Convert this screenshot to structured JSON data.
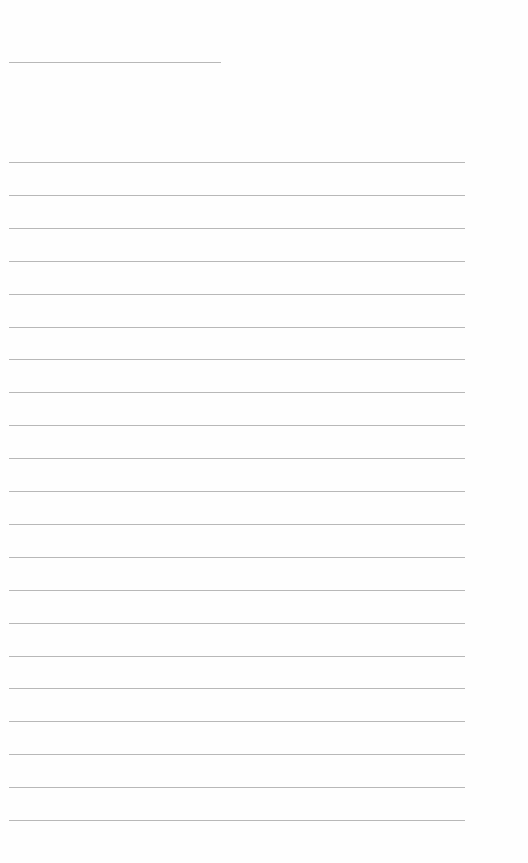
{
  "document": {
    "type": "lined-paper",
    "background_color": "#ffffff",
    "line_color": "#b8b8b8",
    "title_line": {
      "x": 9,
      "y": 62,
      "width": 212
    },
    "ruled_lines": {
      "count": 21,
      "x": 9,
      "width": 456,
      "start_y": 162,
      "spacing": 32.9
    },
    "text": ""
  }
}
